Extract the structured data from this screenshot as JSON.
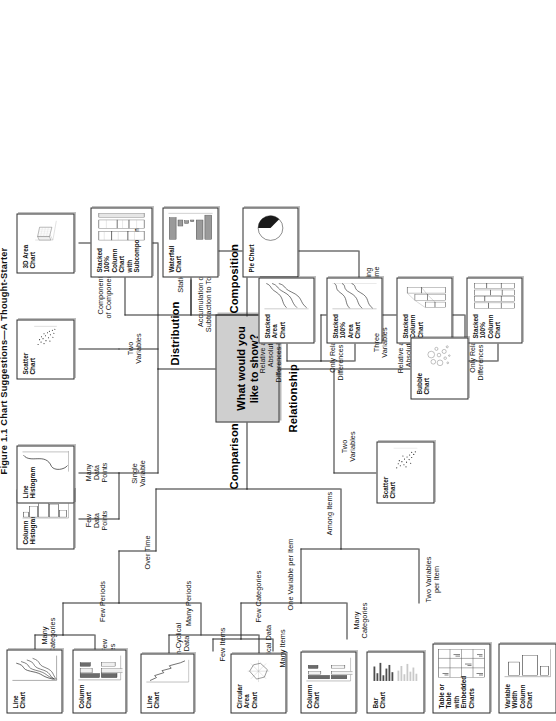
{
  "title": "Figure 1.1   Chart Suggestions—A Thought-Starter",
  "center": {
    "label": "What would you\nlike to show?"
  },
  "categories": {
    "comparison": "Comparison",
    "distribution": "Distribution",
    "composition": "Composition",
    "relationship": "Relationship"
  },
  "branches": {
    "over_time": "Over Time",
    "among_items": "Among Items",
    "few_periods": "Few Periods",
    "many_periods": "Many Periods",
    "many_categories_cmp": "Many\nCategories",
    "single_or_few_categories": "Single or Few\nCategories",
    "cyclical_data": "Cyclical Data",
    "non_cyclical_data": "Non-Cyclical\nData",
    "one_variable_per_item": "One Variable per Item",
    "two_variables_per_item": "Two Variables\nper Item",
    "few_categories": "Few Categories",
    "many_categories_items": "Many\nCategories",
    "few_items": "Few Items",
    "many_items": "Many Items",
    "single_variable": "Single\nVariable",
    "few_data_points": "Few\nData\nPoints",
    "many_data_points": "Many\nData\nPoints",
    "two_variables_dist": "Two\nVariables",
    "three_variables_dist": "Three\nVariables",
    "static": "Static",
    "changing_over_time": "Changing\nOver Time",
    "simple_share_of_total": "Simple Share\nor Total",
    "accumulation": "Accumulation or\nSubtraction to Total",
    "components_of_components": "Components\nof Components",
    "comp_few_periods": "Few Periods",
    "comp_many_periods": "Many Periods",
    "rel_abs_few": "Relative and\nAbsolute\nDifferences Matter",
    "only_rel_few": "Only Relative\nDifferences Matter",
    "rel_abs_many": "Relative and\nAbsolute\nDifferences Matter",
    "only_rel_many": "Only Relative\nDifferences Matter",
    "two_variables_rel": "Two\nVariables",
    "three_variables_rel": "Three\nVariables"
  },
  "charts": {
    "line_chart_many_cat": "Line Chart",
    "column_chart_few_cat": "Column Chart",
    "circular_area_chart": "Circular Area\nChart",
    "line_chart_noncyc": "Line Chart",
    "column_chart_few_items": "Column Chart",
    "bar_chart_many_items": "Bar Chart",
    "table_embedded": "Table or Table with\nEmbedded Charts",
    "variable_width_column": "Variable Width\nColumn Chart",
    "column_histogram": "Column\nHistogram",
    "line_histogram": "Line\nHistogram",
    "scatter_chart_dist": "Scatter Chart",
    "area_chart_3d": "3D Area Chart",
    "pie_chart": "Pie Chart",
    "waterfall_chart": "Waterfall Chart",
    "stacked_100_sub": "Stacked 100%\nColumn Chart with\nSubcomponents",
    "stacked_area_chart": "Stacked Area\nChart",
    "stacked_100_area": "Stacked 100%\nArea Chart",
    "stacked_column_chart": "Stacked\nColumn Chart",
    "stacked_100_column": "Stacked 100%\nColumn Chart",
    "scatter_chart_rel": "Scatter Chart",
    "bubble_chart": "Bubble Chart"
  },
  "colors": {
    "box_fill": "#cfcfcf",
    "stroke": "#2d2d2d",
    "bar_dark": "#6b6b6b",
    "bar_light": "#e8e8e8",
    "background": "#ffffff"
  }
}
